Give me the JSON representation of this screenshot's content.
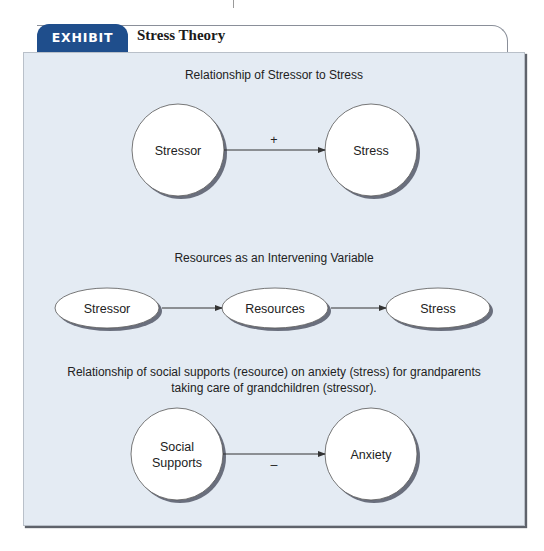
{
  "exhibit": {
    "tab_label": "EXHIBIT 2.1",
    "title": "Stress Theory",
    "tab_color": "#1f4e8c",
    "panel_color": "#e4ebf3"
  },
  "sections": [
    {
      "heading": "Relationship of Stressor to Stress",
      "nodes": [
        {
          "label": "Stressor",
          "shape": "circle"
        },
        {
          "label": "Stress",
          "shape": "circle"
        }
      ],
      "edges": [
        {
          "from": "Stressor",
          "to": "Stress",
          "sign": "+"
        }
      ]
    },
    {
      "heading": "Resources as an Intervening Variable",
      "nodes": [
        {
          "label": "Stressor",
          "shape": "ellipse"
        },
        {
          "label": "Resources",
          "shape": "ellipse"
        },
        {
          "label": "Stress",
          "shape": "ellipse"
        }
      ],
      "edges": [
        {
          "from": "Stressor",
          "to": "Resources"
        },
        {
          "from": "Resources",
          "to": "Stress"
        }
      ]
    },
    {
      "heading_line1": "Relationship of social supports (resource) on anxiety (stress) for grandparents",
      "heading_line2": "taking care of grandchildren (stressor).",
      "nodes": [
        {
          "label_line1": "Social",
          "label_line2": "Supports",
          "shape": "circle"
        },
        {
          "label": "Anxiety",
          "shape": "circle"
        }
      ],
      "edges": [
        {
          "from": "Social Supports",
          "to": "Anxiety",
          "sign": "–"
        }
      ]
    }
  ]
}
